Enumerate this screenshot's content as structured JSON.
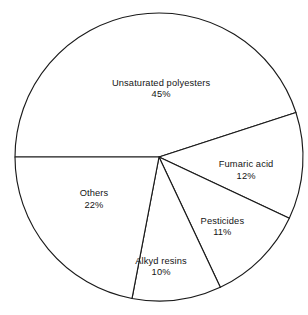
{
  "chart_data": {
    "type": "pie",
    "title": "",
    "subtitle": "",
    "xlabel": "",
    "ylabel": "",
    "legend": "none",
    "grid": false,
    "units": "percent",
    "total": 100,
    "start_angle_deg": 180,
    "direction": "clockwise",
    "categories": [
      "Unsaturated polyesters",
      "Fumaric acid",
      "Pesticides",
      "Alkyd resins",
      "Others"
    ],
    "values": [
      45,
      12,
      11,
      10,
      22
    ],
    "value_labels": [
      "45%",
      "12%",
      "11%",
      "10%",
      "22%"
    ],
    "slices": [
      {
        "name": "Unsaturated polyesters",
        "value": 45,
        "value_label": "45%",
        "color": "#ffffff",
        "stroke": "#1a1a1a",
        "label_x_pct": 52.3,
        "label_y_pct": 28.5
      },
      {
        "name": "Fumaric acid",
        "value": 12,
        "value_label": "12%",
        "color": "#ffffff",
        "stroke": "#1a1a1a",
        "label_x_pct": 79.9,
        "label_y_pct": 54.3
      },
      {
        "name": "Pesticides",
        "value": 11,
        "value_label": "11%",
        "color": "#ffffff",
        "stroke": "#1a1a1a",
        "label_x_pct": 72.2,
        "label_y_pct": 72.3
      },
      {
        "name": "Alkyd resins",
        "value": 10,
        "value_label": "10%",
        "color": "#ffffff",
        "stroke": "#1a1a1a",
        "label_x_pct": 52.3,
        "label_y_pct": 85.0
      },
      {
        "name": "Others",
        "value": 22,
        "value_label": "22%",
        "color": "#ffffff",
        "stroke": "#1a1a1a",
        "label_x_pct": 30.5,
        "label_y_pct": 63.5
      }
    ],
    "geometry": {
      "center_x": 159,
      "center_y": 157,
      "radius": 144
    }
  }
}
